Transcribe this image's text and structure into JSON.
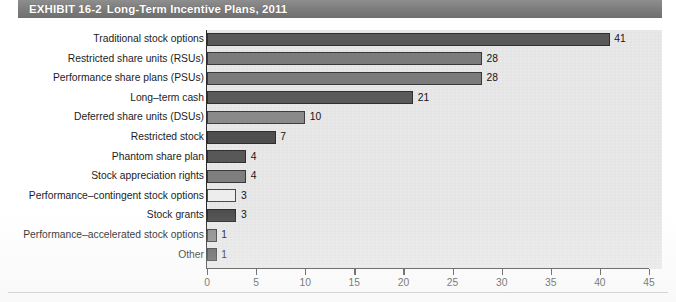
{
  "banner": {
    "exhibit_label": "EXHIBIT 16-2",
    "title": "Long-Term Incentive Plans, 2011"
  },
  "colors": {
    "banner_gray": "#7e7e7e",
    "plot_background": "#e7e7e7",
    "axis": "#2b2b2b",
    "bar_dark": "#595959",
    "bar_medium": "#7b7b7b",
    "bar_light": "#9a9a9a",
    "bar_outline": "#3d3d3d",
    "bar_white": "#ededed"
  },
  "chart_data": {
    "type": "bar",
    "orientation": "horizontal",
    "title": "Long-Term Incentive Plans, 2011",
    "xlabel": "",
    "ylabel": "",
    "xlim": [
      0,
      45
    ],
    "xticks": [
      0,
      5,
      10,
      15,
      20,
      25,
      30,
      35,
      40,
      45
    ],
    "grid": false,
    "legend": "none",
    "categories": [
      "Traditional stock options",
      "Restricted share units (RSUs)",
      "Performance share plans (PSUs)",
      "Long–term cash",
      "Deferred share units (DSUs)",
      "Restricted stock",
      "Phantom share plan",
      "Stock appreciation rights",
      "Performance–contingent stock options",
      "Stock grants",
      "Performance–accelerated stock options",
      "Other"
    ],
    "values": [
      41,
      28,
      28,
      21,
      10,
      7,
      4,
      4,
      3,
      3,
      1,
      1
    ],
    "value_labels": [
      "41",
      "28",
      "28",
      "21",
      "10",
      "7",
      "4",
      "4",
      "3",
      "3",
      "1",
      "1"
    ],
    "bar_colors": [
      "#595959",
      "#7b7b7b",
      "#7b7b7b",
      "#5a5a5a",
      "#8a8a8a",
      "#4f4f4f",
      "#585858",
      "#7e7e7e",
      "#ededed",
      "#4e4e4e",
      "#8a8a8a",
      "#585858"
    ]
  }
}
